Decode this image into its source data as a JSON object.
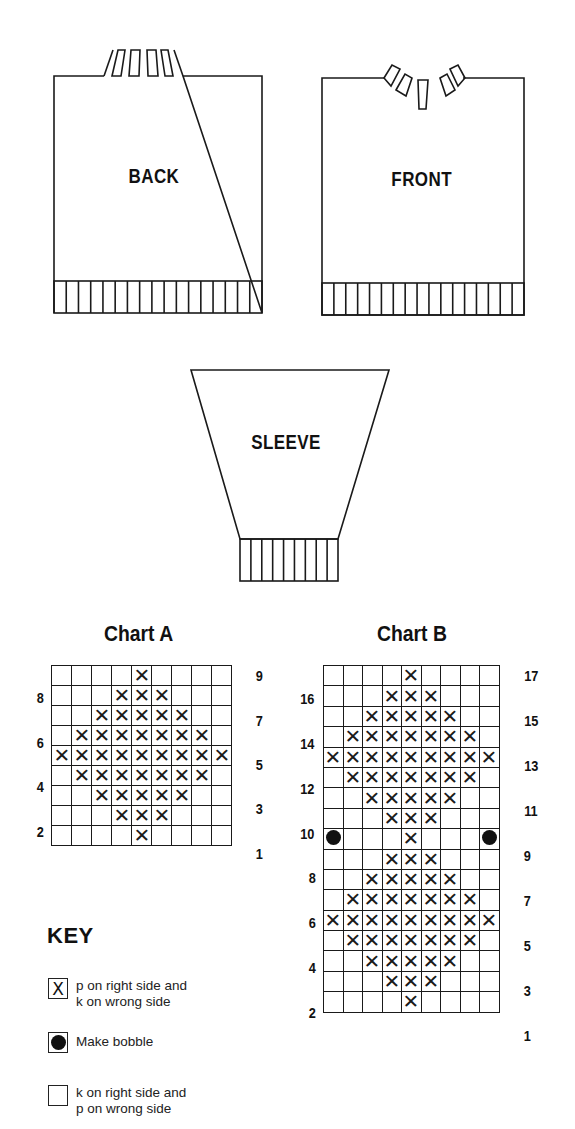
{
  "pieces": {
    "back": {
      "label": "BACK"
    },
    "front": {
      "label": "FRONT"
    },
    "sleeve": {
      "label": "SLEEVE"
    }
  },
  "chart_a": {
    "title": "Chart A",
    "columns": 9,
    "rows": 9,
    "left_row_labels": [
      "8",
      "6",
      "4",
      "2"
    ],
    "right_row_labels": [
      "9",
      "7",
      "5",
      "3",
      "1"
    ],
    "grid_top_to_bottom": [
      "....X....",
      "...XXX...",
      "..XXXXX..",
      ".XXXXXXX.",
      "XXXXXXXXX",
      ".XXXXXXX.",
      "..XXXXX..",
      "...XXX...",
      "....X...."
    ]
  },
  "chart_b": {
    "title": "Chart B",
    "columns": 9,
    "rows": 17,
    "left_row_labels": [
      "16",
      "14",
      "12",
      "10",
      "8",
      "6",
      "4",
      "2"
    ],
    "right_row_labels": [
      "17",
      "15",
      "13",
      "11",
      "9",
      "7",
      "5",
      "3",
      "1"
    ],
    "grid_top_to_bottom": [
      "....X....",
      "...XXX...",
      "..XXXXX..",
      ".XXXXXXX.",
      "XXXXXXXXX",
      ".XXXXXXX.",
      "..XXXXX..",
      "...XXX...",
      "O...X...O",
      "...XXX...",
      "..XXXXX..",
      ".XXXXXXX.",
      "XXXXXXXXX",
      ".XXXXXXX.",
      "..XXXXX..",
      "...XXX...",
      "....X...."
    ]
  },
  "key": {
    "title": "KEY",
    "items": [
      {
        "symbol": "X",
        "icon": "purl-cross-icon",
        "line1": "p on right side and",
        "line2": "k on wrong side"
      },
      {
        "symbol": "●",
        "icon": "bobble-dot-icon",
        "line1": "Make bobble",
        "line2": ""
      },
      {
        "symbol": "",
        "icon": "empty-square-icon",
        "line1": "k on right side and",
        "line2": "p on wrong side"
      }
    ]
  },
  "symbols": {
    "X": "✕",
    "O": "bobble",
    ".": ""
  },
  "colors": {
    "ink": "#111111",
    "background": "#ffffff"
  }
}
